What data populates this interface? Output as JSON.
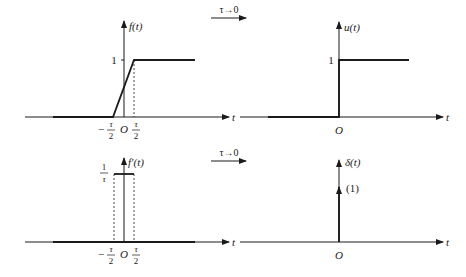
{
  "panels": {
    "top_left": {
      "y_label": "f(t)",
      "level_label": "1",
      "x_label": "t",
      "origin_label": "O",
      "neg_tick_num": "τ",
      "neg_tick_den": "2",
      "neg_sign": "−",
      "pos_tick_num": "τ",
      "pos_tick_den": "2"
    },
    "top_right": {
      "y_label": "u(t)",
      "level_label": "1",
      "x_label": "t",
      "origin_label": "O"
    },
    "bottom_left": {
      "y_label": "f′(t)",
      "level_num": "1",
      "level_den": "τ",
      "x_label": "t",
      "origin_label": "O",
      "neg_tick_num": "τ",
      "neg_tick_den": "2",
      "neg_sign": "−",
      "pos_tick_num": "τ",
      "pos_tick_den": "2"
    },
    "bottom_right": {
      "y_label": "δ(t)",
      "strength_label": "(1)",
      "x_label": "t",
      "origin_label": "O"
    }
  },
  "limit_arrows": {
    "top": "τ→0",
    "bottom": "τ→0"
  },
  "colors": {
    "ink": "#1a1a1a",
    "background": "#ffffff"
  }
}
